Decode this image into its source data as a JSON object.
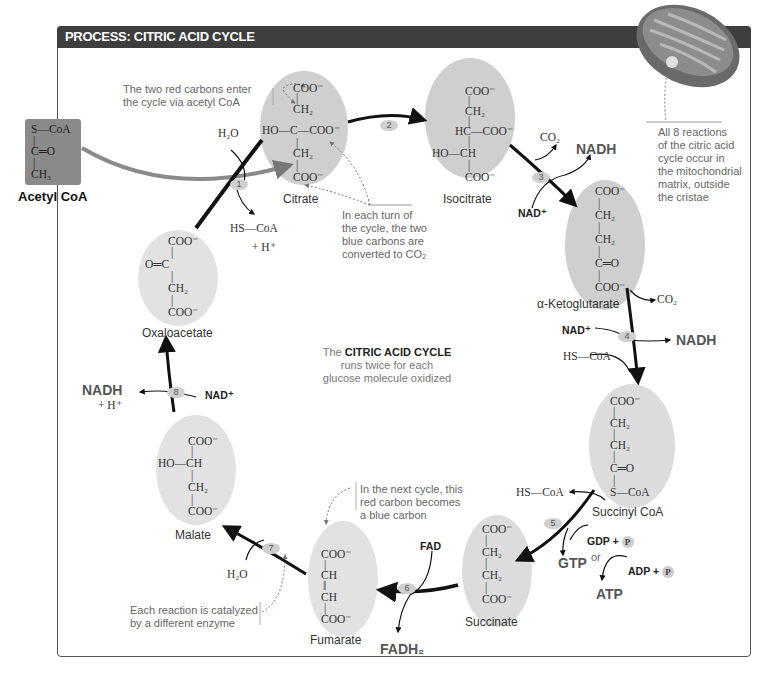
{
  "header": {
    "title": "PROCESS: CITRIC ACID CYCLE"
  },
  "center": {
    "prefix": "The",
    "bold": "CITRIC ACID CYCLE",
    "line2": "runs twice for each",
    "line3": "glucose molecule oxidized"
  },
  "acetyl_coa": {
    "label": "Acetyl CoA",
    "formula": [
      "S—CoA",
      "|",
      "C═O",
      "|",
      "CH₃"
    ]
  },
  "molecules": {
    "citrate": {
      "name": "Citrate",
      "lines": [
        "COO⁻",
        "|",
        "CH₂",
        "HO—C—COO⁻",
        "|",
        "CH₂",
        "|",
        "COO⁻"
      ]
    },
    "isocitrate": {
      "name": "Isocitrate",
      "lines": [
        "COO⁻",
        "|",
        "CH₂",
        "|",
        "HC—COO⁻",
        "|",
        "HO—CH",
        "|",
        "COO⁻"
      ]
    },
    "alpha_ketoglutarate": {
      "name": "α-Ketoglutarate",
      "lines": [
        "COO⁻",
        "|",
        "CH₂",
        "|",
        "CH₂",
        "|",
        "C═O",
        "|",
        "COO⁻"
      ]
    },
    "succinyl_coa": {
      "name": "Succinyl CoA",
      "lines": [
        "COO⁻",
        "|",
        "CH₂",
        "|",
        "CH₂",
        "|",
        "C═O",
        "|",
        "S—CoA"
      ]
    },
    "succinate": {
      "name": "Succinate",
      "lines": [
        "COO⁻",
        "|",
        "CH₂",
        "|",
        "CH₂",
        "|",
        "COO⁻"
      ]
    },
    "fumarate": {
      "name": "Fumarate",
      "lines": [
        "COO⁻",
        "|",
        "CH",
        "‖",
        "CH",
        "|",
        "COO⁻"
      ]
    },
    "malate": {
      "name": "Malate",
      "lines": [
        "COO⁻",
        "|",
        "HO—CH",
        "|",
        "CH₂",
        "|",
        "COO⁻"
      ]
    },
    "oxaloacetate": {
      "name": "Oxaloacetate",
      "lines": [
        "COO⁻",
        "|",
        "O═C",
        "|",
        "CH₂",
        "|",
        "COO⁻"
      ]
    }
  },
  "steps": [
    "1",
    "2",
    "3",
    "4",
    "5",
    "6",
    "7",
    "8"
  ],
  "cofactors": {
    "s1_h2o": "H₂O",
    "s1_hscoa": "HS—CoA",
    "s1_h": "+ H⁺",
    "s3_co2": "CO₂",
    "s3_nadh": "NADH",
    "s3_nad": "NAD⁺",
    "s4_co2": "CO₂",
    "s4_nad": "NAD⁺",
    "s4_nadh": "NADH",
    "s4_hscoa": "HS—CoA",
    "s5_hscoa": "HS—CoA",
    "s5_gdp": "GDP +",
    "s5_pi": "P",
    "s5_gtp": "GTP",
    "s5_or": "or",
    "s5_adp": "ADP +",
    "s5_atp": "ATP",
    "s6_fad": "FAD",
    "s6_fadh2": "FADH₂",
    "s7_h2o": "H₂O",
    "s8_nad": "NAD⁺",
    "s8_nadh": "NADH",
    "s8_h": "+ H⁺"
  },
  "notes": {
    "red_carbons": [
      "The two red carbons enter",
      "the cycle via acetyl CoA"
    ],
    "blue_carbons": [
      "In each turn of",
      "the cycle, the two",
      "blue carbons are",
      "converted to CO₂"
    ],
    "mitochondria": [
      "All 8 reactions",
      "of the citric acid",
      "cycle occur in",
      "the mitochondrial",
      "matrix, outside",
      "the cristae"
    ],
    "next_cycle": [
      "In the next cycle, this",
      "red carbon becomes",
      "a blue carbon"
    ],
    "enzyme": [
      "Each reaction is catalyzed",
      "by a different enzyme"
    ]
  },
  "colors": {
    "header_bg": "#3e3e3e",
    "ellipse_fill": "#cfcfcf",
    "arrow": "#111111",
    "acetyl_box": "#8a8a8a",
    "note_text": "#666666"
  }
}
